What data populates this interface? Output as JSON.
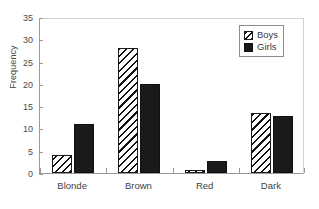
{
  "chart_data": {
    "type": "bar",
    "title": "",
    "subtitle": "",
    "xlabel": "",
    "ylabel": "Frequency",
    "categories": [
      "Blonde",
      "Brown",
      "Red",
      "Dark"
    ],
    "series": [
      {
        "name": "Boys",
        "values": [
          4,
          28,
          0.6,
          13.4
        ],
        "pattern": "diagonal-hatch",
        "color": "#ffffff"
      },
      {
        "name": "Girls",
        "values": [
          11,
          20,
          2.8,
          12.7
        ],
        "pattern": "solid",
        "color": "#1a1a1a"
      }
    ],
    "ylim": [
      0,
      35
    ],
    "ytick_labels": [
      "0",
      "5",
      "10",
      "15",
      "20",
      "25",
      "30",
      "35"
    ],
    "ytick_values": [
      0,
      5,
      10,
      15,
      20,
      25,
      30,
      35
    ],
    "ytick_step": 5,
    "grid": false,
    "legend_position": "top-right",
    "legend_entries": [
      "Boys",
      "Girls"
    ],
    "frame_color": "#9a9a9a",
    "background_color": "#ffffff"
  }
}
